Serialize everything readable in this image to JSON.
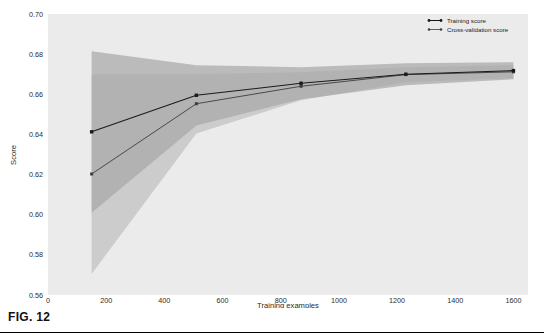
{
  "figure": {
    "caption": "FIG. 12",
    "background_color": "#ffffff",
    "plot_background_color": "#ebebeb"
  },
  "chart_data": {
    "type": "line",
    "title": "",
    "xlabel": "Training examples",
    "ylabel": "Score",
    "xlim": [
      0,
      1650
    ],
    "ylim": [
      0.56,
      0.7
    ],
    "xticks": [
      0,
      200,
      400,
      600,
      800,
      1000,
      1200,
      1400,
      1600
    ],
    "xtick_labels": [
      "0",
      "200",
      "400",
      "600",
      "800",
      "1000",
      "1200",
      "1400",
      "1600"
    ],
    "yticks": [
      0.56,
      0.58,
      0.6,
      0.62,
      0.64,
      0.66,
      0.68,
      0.7
    ],
    "ytick_labels": [
      "0.56",
      "0.58",
      "0.60",
      "0.62",
      "0.64",
      "0.66",
      "0.68",
      "0.70"
    ],
    "grid": false,
    "legend_position": "upper right",
    "x": [
      150,
      510,
      870,
      1230,
      1600
    ],
    "series": [
      {
        "name": "Training score",
        "color": "#1a1a1a",
        "marker": "o",
        "values": [
          0.6413,
          0.6595,
          0.6655,
          0.67,
          0.6718
        ],
        "band_upper": [
          0.6815,
          0.6745,
          0.6735,
          0.6755,
          0.676
        ],
        "band_lower": [
          0.601,
          0.6445,
          0.6575,
          0.6645,
          0.6675
        ]
      },
      {
        "name": "Cross-validation score",
        "color": "#3d3d3d",
        "marker": "o",
        "values": [
          0.6203,
          0.6553,
          0.664,
          0.6698,
          0.6712
        ],
        "band_upper": [
          0.67,
          0.67,
          0.671,
          0.6735,
          0.6745
        ],
        "band_lower": [
          0.5705,
          0.6405,
          0.657,
          0.666,
          0.668
        ]
      }
    ],
    "legend": [
      {
        "label": "Training score",
        "color": "#1a1a1a"
      },
      {
        "label": "Cross-validation score",
        "color": "#3d3d3d"
      }
    ]
  }
}
